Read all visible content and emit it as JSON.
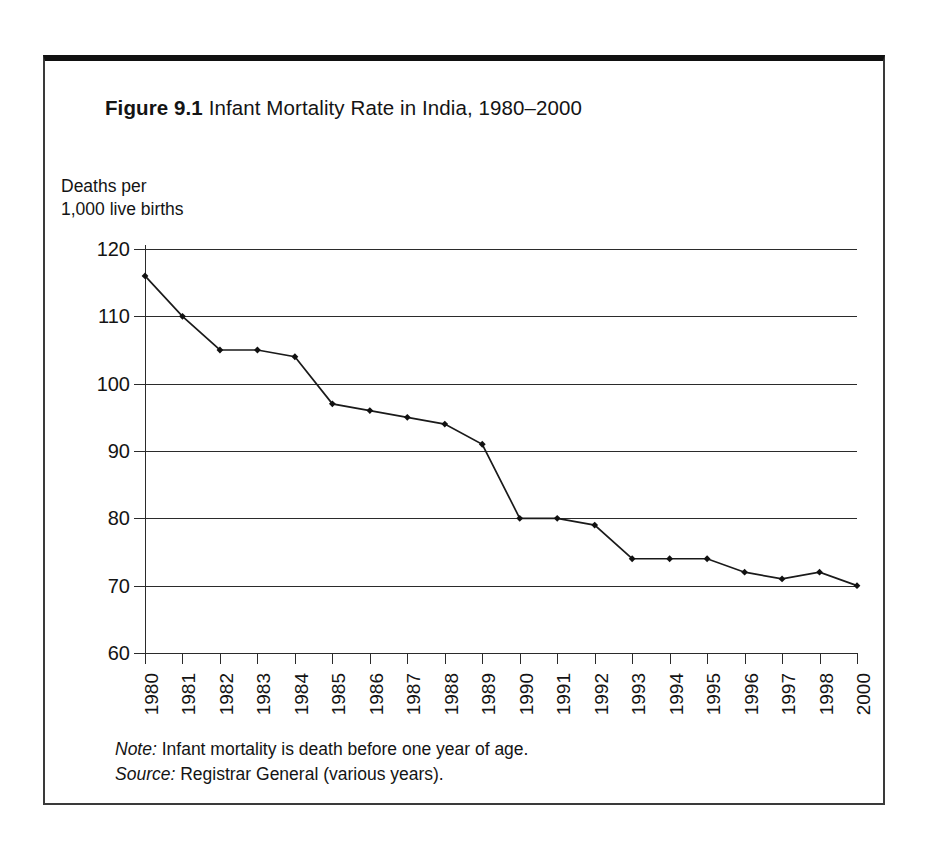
{
  "figure": {
    "number": "Figure 9.1",
    "title": "Infant Mortality Rate in India, 1980–2000",
    "note_label": "Note:",
    "note_text": " Infant mortality is death before one year of age.",
    "source_label": "Source:",
    "source_text": " Registrar General (various years)."
  },
  "chart_data": {
    "type": "line",
    "title": "Infant Mortality Rate in India, 1980–2000",
    "xlabel": "",
    "ylabel": "Deaths per\n1,000 live births",
    "categories": [
      "1980",
      "1981",
      "1982",
      "1983",
      "1984",
      "1985",
      "1986",
      "1987",
      "1988",
      "1989",
      "1990",
      "1991",
      "1992",
      "1993",
      "1994",
      "1995",
      "1996",
      "1997",
      "1998",
      "2000"
    ],
    "values": [
      116,
      110,
      105,
      105,
      104,
      97,
      96,
      95,
      94,
      91,
      80,
      80,
      79,
      74,
      74,
      74,
      72,
      71,
      72,
      70
    ],
    "series": [
      {
        "name": "Infant mortality rate",
        "values": [
          116,
          110,
          105,
          105,
          104,
          97,
          96,
          95,
          94,
          91,
          80,
          80,
          79,
          74,
          74,
          74,
          72,
          71,
          72,
          70
        ]
      }
    ],
    "ylim": [
      60,
      120
    ],
    "ytick_labels": [
      "120",
      "110",
      "100",
      "90",
      "80",
      "70",
      "60"
    ],
    "ytick_values": [
      120,
      110,
      100,
      90,
      80,
      70,
      60
    ],
    "grid": true,
    "grid_axis": "y",
    "legend": "none",
    "marker": "diamond",
    "line_color": "#1a1a1a"
  },
  "colors": {
    "frame": "#111111",
    "axis": "#2b2b2b",
    "line": "#1a1a1a",
    "background": "#ffffff"
  }
}
